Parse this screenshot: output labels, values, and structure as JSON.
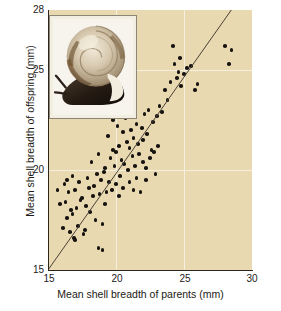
{
  "chart_data": {
    "type": "scatter",
    "title": "",
    "xlabel": "Mean shell breadth of parents (mm)",
    "ylabel": "Mean shell breadth of offspring (mm)",
    "xlim": [
      15,
      30
    ],
    "ylim": [
      15,
      28
    ],
    "xticks": [
      15,
      20,
      25,
      30
    ],
    "yticks": [
      15,
      20,
      25,
      28
    ],
    "xtick_labels": [
      "15",
      "20",
      "25",
      "30"
    ],
    "ytick_labels": [
      "15",
      "20",
      "25",
      "28"
    ],
    "gridlines": {
      "vertical_at": [
        20,
        25
      ],
      "horizontal_at": [
        20,
        25
      ],
      "color": "#f5efe0"
    },
    "legend": null,
    "plot_background": "#e8d9b0",
    "point_color": "#161310",
    "trendline": {
      "label": "regression line",
      "color": "#4a4239",
      "x_start": 15.0,
      "y_start": 15.0,
      "x_end": 29.1,
      "y_end": 28.6
    },
    "points": [
      [
        15.7,
        19.0
      ],
      [
        15.9,
        18.3
      ],
      [
        16.1,
        17.1
      ],
      [
        16.2,
        19.3
      ],
      [
        16.3,
        18.4
      ],
      [
        16.4,
        17.6
      ],
      [
        16.5,
        18.9
      ],
      [
        16.6,
        16.9
      ],
      [
        16.7,
        18.0
      ],
      [
        16.8,
        17.8
      ],
      [
        16.9,
        16.6
      ],
      [
        17.0,
        16.5
      ],
      [
        17.1,
        18.1
      ],
      [
        17.2,
        17.2
      ],
      [
        17.3,
        19.4
      ],
      [
        17.4,
        18.5
      ],
      [
        17.5,
        18.6
      ],
      [
        17.6,
        16.8
      ],
      [
        17.7,
        17.0
      ],
      [
        17.8,
        18.2
      ],
      [
        17.9,
        19.6
      ],
      [
        18.0,
        19.1
      ],
      [
        18.1,
        17.9
      ],
      [
        18.2,
        20.4
      ],
      [
        18.3,
        18.7
      ],
      [
        18.4,
        19.2
      ],
      [
        18.5,
        17.5
      ],
      [
        18.6,
        19.8
      ],
      [
        18.7,
        20.8
      ],
      [
        18.8,
        18.8
      ],
      [
        18.9,
        19.5
      ],
      [
        19.0,
        17.3
      ],
      [
        19.0,
        16.0
      ],
      [
        19.1,
        19.9
      ],
      [
        19.2,
        20.1
      ],
      [
        19.3,
        18.9
      ],
      [
        19.4,
        21.7
      ],
      [
        19.5,
        19.4
      ],
      [
        19.6,
        20.6
      ],
      [
        19.7,
        19.0
      ],
      [
        19.8,
        21.0
      ],
      [
        19.9,
        20.2
      ],
      [
        20.0,
        19.3
      ],
      [
        20.0,
        20.9
      ],
      [
        20.1,
        22.2
      ],
      [
        20.2,
        21.2
      ],
      [
        20.3,
        19.7
      ],
      [
        20.4,
        20.5
      ],
      [
        20.5,
        21.9
      ],
      [
        20.5,
        19.1
      ],
      [
        20.6,
        20.3
      ],
      [
        20.7,
        22.6
      ],
      [
        20.8,
        21.4
      ],
      [
        20.9,
        20.0
      ],
      [
        21.0,
        21.1
      ],
      [
        21.0,
        19.4
      ],
      [
        21.1,
        22.0
      ],
      [
        21.2,
        20.7
      ],
      [
        21.3,
        21.6
      ],
      [
        21.4,
        20.2
      ],
      [
        21.5,
        22.3
      ],
      [
        21.5,
        19.6
      ],
      [
        21.6,
        21.3
      ],
      [
        21.7,
        20.8
      ],
      [
        21.8,
        18.9
      ],
      [
        21.9,
        22.1
      ],
      [
        22.0,
        21.5
      ],
      [
        22.0,
        20.4
      ],
      [
        22.1,
        22.8
      ],
      [
        22.2,
        20.1
      ],
      [
        22.3,
        21.8
      ],
      [
        22.4,
        23.0
      ],
      [
        22.5,
        20.6
      ],
      [
        22.6,
        21.0
      ],
      [
        22.7,
        22.4
      ],
      [
        22.8,
        20.9
      ],
      [
        22.9,
        19.8
      ],
      [
        23.0,
        22.7
      ],
      [
        23.1,
        21.2
      ],
      [
        23.2,
        23.2
      ],
      [
        23.4,
        22.9
      ],
      [
        23.6,
        24.0
      ],
      [
        23.8,
        23.5
      ],
      [
        24.0,
        24.4
      ],
      [
        24.2,
        26.2
      ],
      [
        24.3,
        25.3
      ],
      [
        24.5,
        24.6
      ],
      [
        24.6,
        24.9
      ],
      [
        24.7,
        25.6
      ],
      [
        24.8,
        24.2
      ],
      [
        25.0,
        24.8
      ],
      [
        25.2,
        25.1
      ],
      [
        25.5,
        25.2
      ],
      [
        25.8,
        24.0
      ],
      [
        26.0,
        24.3
      ],
      [
        28.0,
        26.2
      ],
      [
        28.3,
        25.3
      ],
      [
        28.5,
        26.0
      ],
      [
        18.7,
        16.1
      ],
      [
        17.0,
        19.0
      ],
      [
        19.2,
        18.3
      ],
      [
        20.2,
        18.7
      ],
      [
        21.3,
        19.0
      ],
      [
        22.2,
        19.5
      ],
      [
        20.6,
        22.9
      ],
      [
        21.1,
        23.1
      ],
      [
        19.8,
        22.5
      ],
      [
        20.4,
        23.4
      ],
      [
        16.4,
        19.5
      ],
      [
        16.8,
        19.7
      ]
    ]
  },
  "inset": {
    "name": "snail-photograph",
    "description": "Land snail with coiled shell",
    "border_color": "#8d8676",
    "mat_color": "#f3eee2"
  },
  "figure": {
    "background": "#ffffff"
  }
}
